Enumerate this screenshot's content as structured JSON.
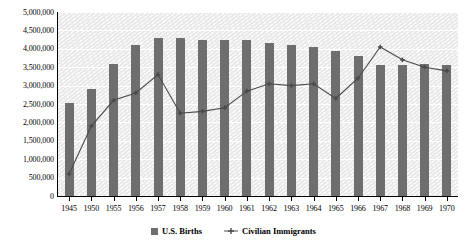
{
  "chart_data": {
    "type": "bar",
    "title": "",
    "subtitle": "",
    "xlabel": "",
    "ylabel": "",
    "ylim": [
      0,
      5000000
    ],
    "ytick_step": 500000,
    "grid": true,
    "legend_position": "bottom",
    "categories": [
      "1945",
      "1950",
      "1955",
      "1956",
      "1957",
      "1958",
      "1959",
      "1960",
      "1961",
      "1962",
      "1963",
      "1964",
      "1965",
      "1966",
      "1967",
      "1968",
      "1969",
      "1970"
    ],
    "ytick_labels": [
      "5,000,000",
      "4,500,000",
      "4,000,000",
      "3,500,000",
      "3,000,000",
      "2,500,000",
      "2,000,000",
      "1,500,000",
      "1,000,000",
      "500,000",
      "0"
    ],
    "ytick_values": [
      5000000,
      4500000,
      4000000,
      3500000,
      3000000,
      2500000,
      2000000,
      1500000,
      1000000,
      500000,
      0
    ],
    "series": [
      {
        "name": "U.S. Births",
        "type": "bar",
        "color": "#6e6e6e",
        "values": [
          2530000,
          2900000,
          3600000,
          4100000,
          4300000,
          4300000,
          4250000,
          4250000,
          4250000,
          4150000,
          4100000,
          4050000,
          3950000,
          3800000,
          3550000,
          3550000,
          3600000,
          3550000
        ]
      },
      {
        "name": "Civilian Immigrants",
        "type": "line",
        "color": "#4a4a4a",
        "marker": "plus",
        "values": [
          600000,
          1900000,
          2600000,
          2800000,
          3300000,
          2250000,
          2300000,
          2400000,
          2850000,
          3050000,
          3000000,
          3050000,
          2650000,
          3200000,
          4050000,
          3700000,
          3500000,
          3400000
        ]
      }
    ]
  },
  "legend": {
    "entries": [
      {
        "label": "U.S. Births",
        "marker": "square"
      },
      {
        "label": "Civilian Immigrants",
        "marker": "plus-line"
      }
    ]
  }
}
